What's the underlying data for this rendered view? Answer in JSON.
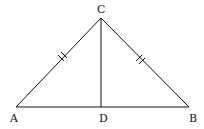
{
  "diagram": {
    "type": "isosceles-triangle",
    "vertices": {
      "A": {
        "label": "A",
        "x": 16,
        "y": 107
      },
      "B": {
        "label": "B",
        "x": 189,
        "y": 107
      },
      "C": {
        "label": "C",
        "x": 101,
        "y": 18
      },
      "D": {
        "label": "D",
        "x": 101,
        "y": 107
      }
    },
    "segments": [
      "AC",
      "CB",
      "AB",
      "CD"
    ],
    "equal_marks": {
      "AC": "double-tick",
      "BC": "double-tick"
    },
    "colors": {
      "stroke": "#111111",
      "background": "#ffffff"
    }
  }
}
